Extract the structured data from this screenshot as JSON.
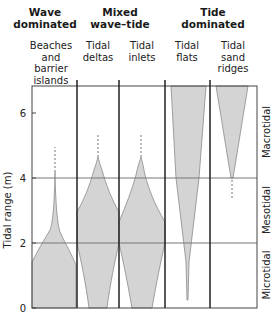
{
  "groups": [
    {
      "label_line1": "Wave",
      "label_line2": "dominated"
    },
    {
      "label_line1": "Mixed",
      "label_line2": "wave–tide"
    },
    {
      "label_line1": "Tide",
      "label_line2": "dominated"
    }
  ],
  "columns": [
    {
      "lines": [
        "Beaches",
        "and",
        "barrier",
        "islands"
      ]
    },
    {
      "lines": [
        "Tidal",
        "deltas"
      ]
    },
    {
      "lines": [
        "Tidal",
        "inlets"
      ]
    },
    {
      "lines": [
        "Tidal",
        "flats"
      ]
    },
    {
      "lines": [
        "Tidal",
        "sand",
        "ridges"
      ]
    }
  ],
  "y_axis": {
    "label": "Tidal range (m)",
    "ticks": [
      "0",
      "2",
      "4",
      "6"
    ]
  },
  "zones": [
    {
      "label": "Macrotidal"
    },
    {
      "label": "Mesotidal"
    },
    {
      "label": "Microtidal"
    }
  ],
  "colors": {
    "fill": "#d4d4d4",
    "outline": "#8a8a8a",
    "frame": "#333333",
    "gridline": "#777777"
  }
}
